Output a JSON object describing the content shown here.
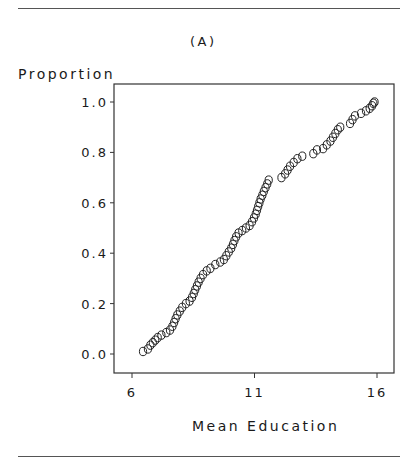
{
  "figure": {
    "panel_label": "(A)",
    "y_axis_title": "Proportion",
    "x_axis_title": "Mean Education"
  },
  "chart_data": {
    "type": "scatter",
    "title": "(A)",
    "xlabel": "Mean Education",
    "ylabel": "Proportion",
    "xlim": [
      5.3,
      17.0
    ],
    "ylim": [
      -0.08,
      1.07
    ],
    "x_ticks": [
      6,
      11,
      16
    ],
    "x_tick_labels": [
      "6",
      "11",
      "16"
    ],
    "y_ticks": [
      0.0,
      0.2,
      0.4,
      0.6,
      0.8,
      1.0
    ],
    "y_tick_labels": [
      "0.0",
      "0.2",
      "0.4",
      "0.6",
      "0.8",
      "1.0"
    ],
    "grid": false,
    "legend": null,
    "marker": "open-circle",
    "series": [
      {
        "name": "Empirical cumulative proportion",
        "points": [
          [
            6.45,
            0.01
          ],
          [
            6.65,
            0.02
          ],
          [
            6.75,
            0.035
          ],
          [
            6.85,
            0.045
          ],
          [
            6.95,
            0.055
          ],
          [
            7.05,
            0.065
          ],
          [
            7.2,
            0.075
          ],
          [
            7.4,
            0.085
          ],
          [
            7.55,
            0.095
          ],
          [
            7.65,
            0.11
          ],
          [
            7.72,
            0.125
          ],
          [
            7.78,
            0.14
          ],
          [
            7.85,
            0.155
          ],
          [
            7.95,
            0.17
          ],
          [
            8.05,
            0.185
          ],
          [
            8.2,
            0.2
          ],
          [
            8.35,
            0.21
          ],
          [
            8.45,
            0.225
          ],
          [
            8.52,
            0.24
          ],
          [
            8.58,
            0.255
          ],
          [
            8.65,
            0.27
          ],
          [
            8.72,
            0.285
          ],
          [
            8.8,
            0.3
          ],
          [
            8.9,
            0.315
          ],
          [
            9.05,
            0.33
          ],
          [
            9.2,
            0.34
          ],
          [
            9.4,
            0.355
          ],
          [
            9.6,
            0.365
          ],
          [
            9.75,
            0.375
          ],
          [
            9.85,
            0.39
          ],
          [
            9.95,
            0.405
          ],
          [
            10.05,
            0.42
          ],
          [
            10.12,
            0.435
          ],
          [
            10.18,
            0.45
          ],
          [
            10.25,
            0.465
          ],
          [
            10.35,
            0.48
          ],
          [
            10.5,
            0.49
          ],
          [
            10.65,
            0.5
          ],
          [
            10.8,
            0.51
          ],
          [
            10.9,
            0.525
          ],
          [
            10.98,
            0.54
          ],
          [
            11.05,
            0.555
          ],
          [
            11.1,
            0.57
          ],
          [
            11.15,
            0.585
          ],
          [
            11.2,
            0.6
          ],
          [
            11.25,
            0.615
          ],
          [
            11.32,
            0.63
          ],
          [
            11.38,
            0.645
          ],
          [
            11.45,
            0.66
          ],
          [
            11.52,
            0.675
          ],
          [
            11.58,
            0.69
          ],
          [
            12.1,
            0.7
          ],
          [
            12.25,
            0.715
          ],
          [
            12.35,
            0.73
          ],
          [
            12.45,
            0.745
          ],
          [
            12.6,
            0.76
          ],
          [
            12.75,
            0.775
          ],
          [
            12.95,
            0.785
          ],
          [
            13.4,
            0.795
          ],
          [
            13.55,
            0.81
          ],
          [
            13.8,
            0.815
          ],
          [
            13.95,
            0.83
          ],
          [
            14.1,
            0.845
          ],
          [
            14.2,
            0.86
          ],
          [
            14.3,
            0.875
          ],
          [
            14.4,
            0.89
          ],
          [
            14.5,
            0.9
          ],
          [
            14.9,
            0.915
          ],
          [
            15.0,
            0.93
          ],
          [
            15.1,
            0.945
          ],
          [
            15.35,
            0.955
          ],
          [
            15.55,
            0.965
          ],
          [
            15.7,
            0.975
          ],
          [
            15.8,
            0.985
          ],
          [
            15.85,
            0.995
          ],
          [
            15.9,
            1.0
          ]
        ]
      }
    ]
  }
}
